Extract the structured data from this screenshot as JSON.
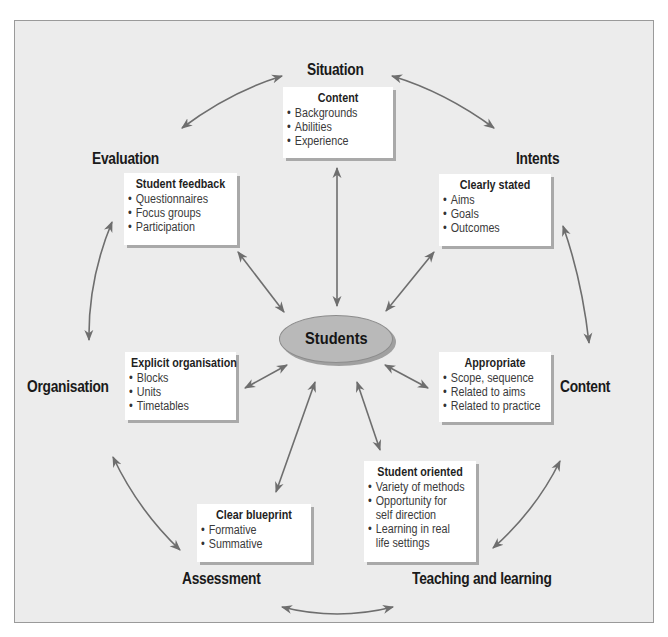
{
  "diagram": {
    "center": {
      "label": "Students",
      "fill_color": "#b9b9b9"
    },
    "arrow_color": "#6e6e6e",
    "background_color": "#ececec",
    "nodes": [
      {
        "id": "situation",
        "label": "Situation",
        "box": {
          "title": "Content",
          "items": [
            "Backgrounds",
            "Abilities",
            "Experience"
          ]
        }
      },
      {
        "id": "intents",
        "label": "Intents",
        "box": {
          "title": "Clearly stated",
          "items": [
            "Aims",
            "Goals",
            "Outcomes"
          ]
        }
      },
      {
        "id": "content",
        "label": "Content",
        "box": {
          "title": "Appropriate",
          "items": [
            "Scope, sequence",
            "Related to aims",
            "Related to practice"
          ]
        }
      },
      {
        "id": "teaching",
        "label": "Teaching and learning",
        "box": {
          "title": "Student oriented",
          "items": [
            "Variety of methods",
            "Opportunity for",
            "self direction",
            "Learning in real",
            "life settings"
          ]
        }
      },
      {
        "id": "assessment",
        "label": "Assessment",
        "box": {
          "title": "Clear blueprint",
          "items": [
            "Formative",
            "Summative"
          ]
        }
      },
      {
        "id": "organisation",
        "label": "Organisation",
        "box": {
          "title": "Explicit organisation",
          "items": [
            "Blocks",
            "Units",
            "Timetables"
          ]
        }
      },
      {
        "id": "evaluation",
        "label": "Evaluation",
        "box": {
          "title": "Student feedback",
          "items": [
            "Questionnaires",
            "Focus groups",
            "Participation"
          ]
        }
      }
    ],
    "connections": [
      {
        "from": "situation",
        "to": "intents",
        "type": "bidirectional"
      },
      {
        "from": "intents",
        "to": "content",
        "type": "bidirectional"
      },
      {
        "from": "content",
        "to": "teaching",
        "type": "bidirectional"
      },
      {
        "from": "teaching",
        "to": "assessment",
        "type": "bidirectional"
      },
      {
        "from": "assessment",
        "to": "organisation",
        "type": "bidirectional"
      },
      {
        "from": "organisation",
        "to": "evaluation",
        "type": "bidirectional"
      },
      {
        "from": "evaluation",
        "to": "situation",
        "type": "bidirectional"
      },
      {
        "from": "students",
        "to": "situation",
        "type": "bidirectional"
      },
      {
        "from": "students",
        "to": "intents",
        "type": "bidirectional"
      },
      {
        "from": "students",
        "to": "content",
        "type": "bidirectional"
      },
      {
        "from": "students",
        "to": "teaching",
        "type": "bidirectional"
      },
      {
        "from": "students",
        "to": "assessment",
        "type": "bidirectional"
      },
      {
        "from": "students",
        "to": "organisation",
        "type": "bidirectional"
      },
      {
        "from": "students",
        "to": "evaluation",
        "type": "bidirectional"
      }
    ]
  }
}
